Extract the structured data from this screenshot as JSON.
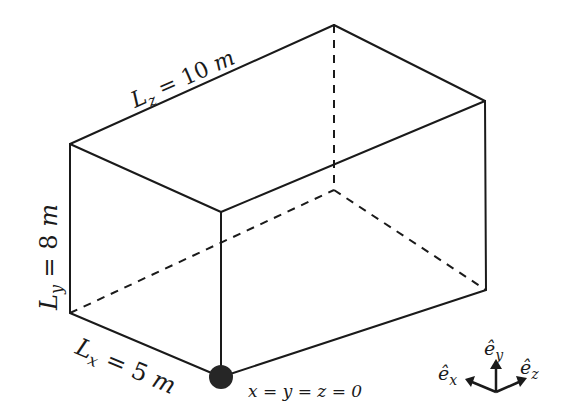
{
  "diagram": {
    "dimensions": {
      "lz": {
        "symbol": "L",
        "sub": "z",
        "eq": " = 10 ",
        "unit": "m"
      },
      "ly": {
        "symbol": "L",
        "sub": "y",
        "eq": " = 8 ",
        "unit": "m"
      },
      "lx": {
        "symbol": "L",
        "sub": "x",
        "eq": " = 5 ",
        "unit": "m"
      }
    },
    "origin_label": "x = y = z = 0",
    "axes": {
      "ex": {
        "base": "ê",
        "sub": "x"
      },
      "ey": {
        "base": "ê",
        "sub": "y"
      },
      "ez": {
        "base": "ê",
        "sub": "z"
      }
    },
    "colors": {
      "line": "#1a1a1a",
      "origin": "#262626"
    }
  }
}
